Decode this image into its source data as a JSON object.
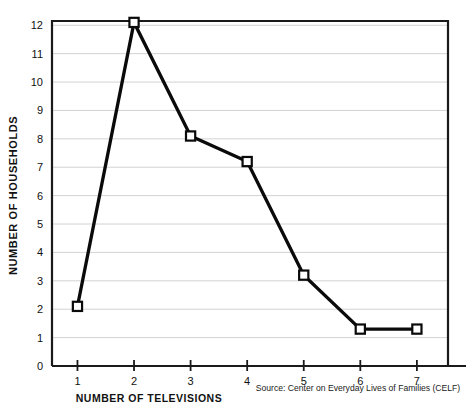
{
  "chart_data": {
    "type": "line",
    "title": "",
    "xlabel": "NUMBER OF TELEVISIONS",
    "ylabel": "NUMBER OF HOUSEHOLDS",
    "x": [
      1,
      2,
      3,
      4,
      5,
      6,
      7
    ],
    "values": [
      2.1,
      12.1,
      8.1,
      7.2,
      3.2,
      1.3,
      1.3
    ],
    "xticklabels": [
      "1",
      "2",
      "3",
      "4",
      "5",
      "6",
      "7"
    ],
    "yticklabels": [
      "0",
      "1",
      "2",
      "3",
      "4",
      "5",
      "6",
      "7",
      "8",
      "9",
      "10",
      "11",
      "12"
    ],
    "xlim": [
      0.55,
      7.55
    ],
    "ylim": [
      0,
      12.15
    ],
    "grid": "horizontal",
    "legend": "none",
    "marker": "open-square",
    "line_color": "#0a0a0a",
    "marker_fill": "#ffffff",
    "grid_color": "#d2d2d2",
    "axis_color": "#1a1a1a",
    "background": "#ffffff",
    "source_note": "Source: Center on Everyday Lives of Families (CELF)"
  }
}
